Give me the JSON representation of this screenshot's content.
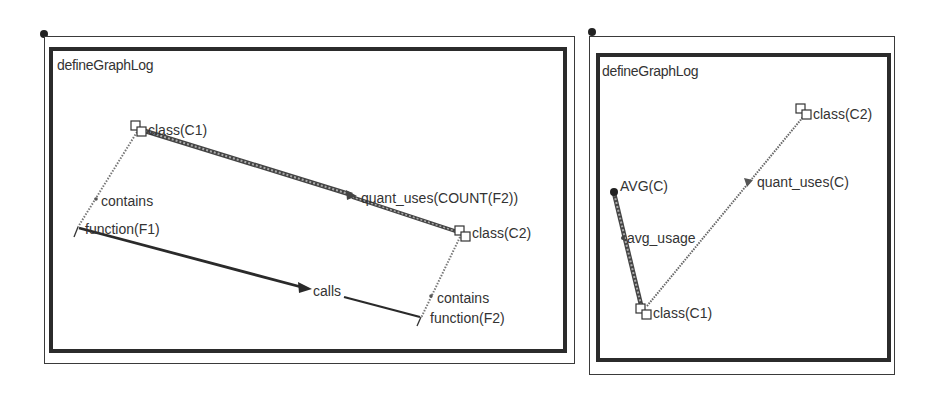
{
  "panels": [
    {
      "title": "defineGraphLog",
      "nodes": [
        {
          "id": "class_c1",
          "label": "class(C1)",
          "shape": "class-box"
        },
        {
          "id": "function_f1",
          "label": "function(F1)",
          "shape": "point"
        },
        {
          "id": "class_c2",
          "label": "class(C2)",
          "shape": "class-box"
        },
        {
          "id": "function_f2",
          "label": "function(F2)",
          "shape": "point"
        }
      ],
      "edges": [
        {
          "from": "class_c1",
          "to": "function_f1",
          "label": "contains",
          "style": "dotted"
        },
        {
          "from": "class_c1",
          "to": "class_c2",
          "label": "quant_uses(COUNT(F2))",
          "style": "hatched-thick"
        },
        {
          "from": "function_f1",
          "to": "function_f2",
          "label": "calls",
          "style": "solid-thick"
        },
        {
          "from": "class_c2",
          "to": "function_f2",
          "label": "contains",
          "style": "dotted"
        }
      ]
    },
    {
      "title": "defineGraphLog",
      "nodes": [
        {
          "id": "class_c2",
          "label": "class(C2)",
          "shape": "class-box"
        },
        {
          "id": "avg_c",
          "label": "AVG(C)",
          "shape": "dot"
        },
        {
          "id": "class_c1",
          "label": "class(C1)",
          "shape": "class-box"
        }
      ],
      "edges": [
        {
          "from": "class_c1",
          "to": "class_c2",
          "label": "quant_uses(C)",
          "style": "dotted"
        },
        {
          "from": "class_c1",
          "to": "avg_c",
          "label": "avg_usage",
          "style": "hatched-thick"
        }
      ]
    }
  ],
  "colors": {
    "frame": "#2b2b2b",
    "ink": "#333333",
    "background": "#ffffff"
  }
}
